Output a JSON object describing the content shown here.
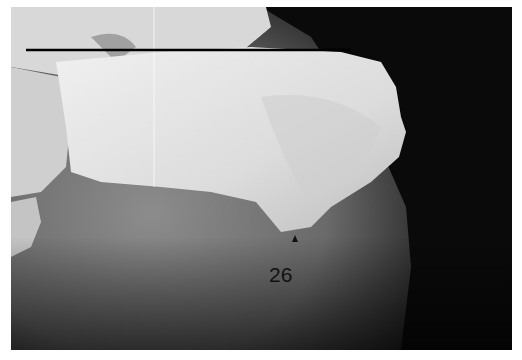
{
  "image": {
    "subject": "lateral radiograph of calcaneus (heel bone)",
    "annotation_label": "26",
    "marker": "arrowhead",
    "reference_line": "horizontal line across superior calcaneus",
    "colors": {
      "background": "#0a0a0a",
      "bone": "#e6e6e6",
      "soft_tissue": "#7a7a7a",
      "line": "#000000"
    }
  }
}
